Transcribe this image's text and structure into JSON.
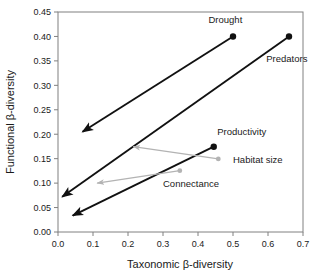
{
  "chart_data": {
    "type": "scatter",
    "title": "",
    "xlabel": "Taxonomic β-diversity",
    "ylabel": "Functional β-diversity",
    "xlim": [
      0.0,
      0.7
    ],
    "ylim": [
      0.0,
      0.45
    ],
    "xticks": [
      "0.0",
      "0.1",
      "0.2",
      "0.3",
      "0.4",
      "0.5",
      "0.6",
      "0.7"
    ],
    "xtick_values": [
      0.0,
      0.1,
      0.2,
      0.3,
      0.4,
      0.5,
      0.6,
      0.7
    ],
    "yticks": [
      "0.00",
      "0.05",
      "0.10",
      "0.15",
      "0.20",
      "0.25",
      "0.30",
      "0.35",
      "0.40",
      "0.45"
    ],
    "ytick_values": [
      0.0,
      0.05,
      0.1,
      0.15,
      0.2,
      0.25,
      0.3,
      0.35,
      0.4,
      0.45
    ],
    "grid": false,
    "legend_position": "inline-labels",
    "colors": {
      "strong_effect": "#111111",
      "weak_effect": "#b3b3b3",
      "axis": "#808080",
      "text": "#1a1a1a"
    },
    "series": [
      {
        "name": "Drought",
        "label": "Drought",
        "color": "#111111",
        "emphasis": "strong",
        "start": {
          "x": 0.5,
          "y": 0.4
        },
        "end": {
          "x": 0.07,
          "y": 0.205
        },
        "marker": "filled-circle",
        "arrow": "at-end",
        "label_x": 0.43,
        "label_y": 0.435
      },
      {
        "name": "Predators",
        "label": "Predators",
        "color": "#111111",
        "emphasis": "strong",
        "start": {
          "x": 0.66,
          "y": 0.4
        },
        "end": {
          "x": 0.012,
          "y": 0.072
        },
        "marker": "filled-circle",
        "arrow": "at-end",
        "label_x": 0.595,
        "label_y": 0.355
      },
      {
        "name": "Productivity",
        "label": "Productivity",
        "color": "#111111",
        "emphasis": "strong",
        "start": {
          "x": 0.445,
          "y": 0.1745
        },
        "end": {
          "x": 0.042,
          "y": 0.0335
        },
        "marker": "filled-circle",
        "arrow": "at-end",
        "label_x": 0.455,
        "label_y": 0.205
      },
      {
        "name": "Habitat size",
        "label": "Habitat size",
        "color": "#b3b3b3",
        "emphasis": "weak",
        "start": {
          "x": 0.458,
          "y": 0.1495
        },
        "end": {
          "x": 0.215,
          "y": 0.1745
        },
        "marker": "filled-circle",
        "arrow": "at-end",
        "label_x": 0.5,
        "label_y": 0.148
      },
      {
        "name": "Connectance",
        "label": "Connectance",
        "color": "#b3b3b3",
        "emphasis": "weak",
        "start": {
          "x": 0.348,
          "y": 0.1255
        },
        "end": {
          "x": 0.112,
          "y": 0.1
        },
        "marker": "filled-circle",
        "arrow": "at-end",
        "label_x": 0.3,
        "label_y": 0.098
      }
    ]
  }
}
